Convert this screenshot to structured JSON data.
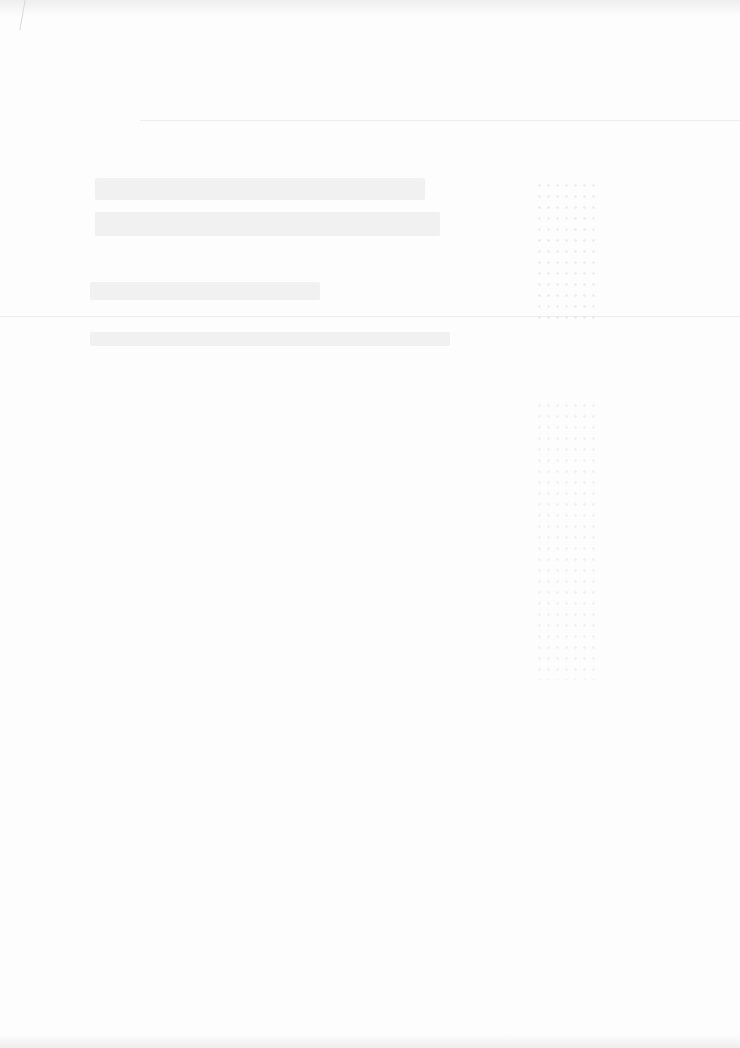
{
  "document": {
    "type": "scanned-page",
    "legible": false,
    "colors": {
      "paper": "#fdfdfd",
      "ink_faded": "#f1f1f1",
      "rule": "#ededed"
    },
    "regions": [
      {
        "name": "title-block",
        "lines": 2
      },
      {
        "name": "subtitle-line",
        "lines": 1
      },
      {
        "name": "caption-line",
        "lines": 1
      },
      {
        "name": "right-column-marks",
        "lines": 0
      }
    ]
  }
}
